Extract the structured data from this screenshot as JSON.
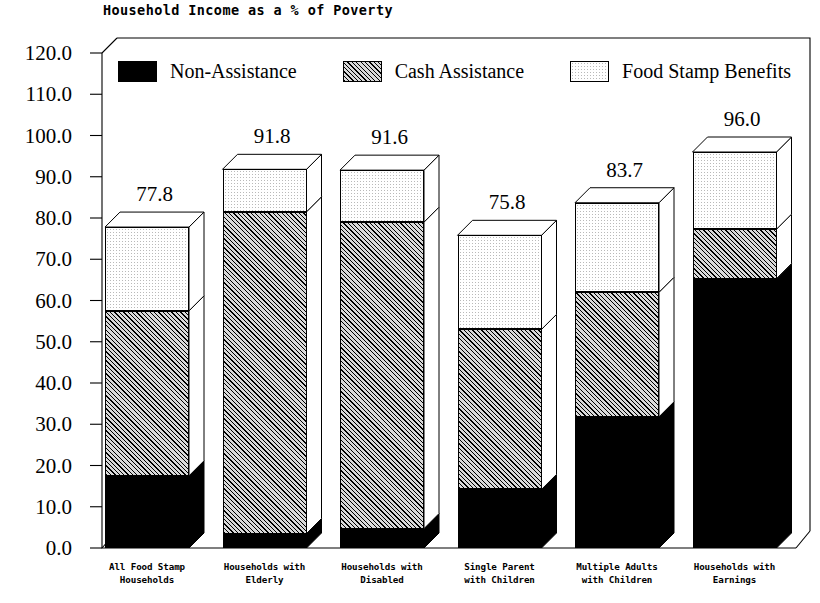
{
  "chart_data": {
    "type": "bar",
    "subtype": "stacked-bar-3d",
    "title": "Household Income as a % of Poverty",
    "xlabel": "",
    "ylabel": "",
    "ylim": [
      0.0,
      120.0
    ],
    "ytick_step": 10.0,
    "ytick_labels": [
      "0.0",
      "10.0",
      "20.0",
      "30.0",
      "40.0",
      "50.0",
      "60.0",
      "70.0",
      "80.0",
      "90.0",
      "100.0",
      "110.0",
      "120.0"
    ],
    "grid": false,
    "legend_position": "top-inside",
    "categories": [
      "All Food Stamp Households",
      "Households with Elderly",
      "Households with Disabled",
      "Single Parent with Children",
      "Multiple Adults with Children",
      "Households with Earnings"
    ],
    "category_lines": [
      [
        "All Food Stamp",
        "Households"
      ],
      [
        "Households with",
        "Elderly"
      ],
      [
        "Households with",
        "Disabled"
      ],
      [
        "Single Parent",
        "with Children"
      ],
      [
        "Multiple Adults",
        "with Children"
      ],
      [
        "Households with",
        "Earnings"
      ]
    ],
    "series": [
      {
        "name": "Non-Assistance",
        "fill": "black",
        "values": [
          17.5,
          3.5,
          4.7,
          14.2,
          31.8,
          65.3
        ]
      },
      {
        "name": "Cash Assistance",
        "fill": "hatch",
        "values": [
          40.0,
          78.0,
          74.3,
          38.8,
          30.2,
          12.0
        ]
      },
      {
        "name": "Food Stamp Benefits",
        "fill": "dots",
        "values": [
          20.3,
          10.3,
          12.6,
          22.8,
          21.7,
          18.7
        ]
      }
    ],
    "totals": [
      77.8,
      91.8,
      91.6,
      75.8,
      83.7,
      96.0
    ],
    "value_labels": [
      "77.8",
      "91.8",
      "91.6",
      "75.8",
      "83.7",
      "96.0"
    ],
    "colors": {
      "non_assistance": "#000000",
      "cash_assistance": "#d9d9d9",
      "food_stamp_benefits": "#ffffff",
      "outline": "#000000",
      "background": "#ffffff"
    }
  },
  "legend": {
    "items": [
      {
        "label": "Non-Assistance",
        "swatch": "black"
      },
      {
        "label": "Cash Assistance",
        "swatch": "hatch"
      },
      {
        "label": "Food Stamp Benefits",
        "swatch": "dots"
      }
    ]
  }
}
